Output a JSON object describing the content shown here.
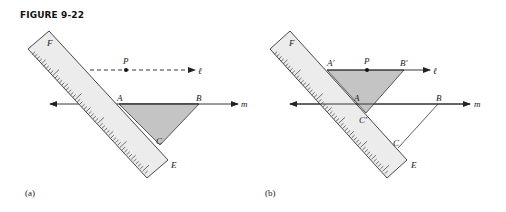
{
  "figure": {
    "title": "FIGURE 9-22"
  },
  "panels": [
    {
      "caption": "(a)",
      "labels": {
        "F": "F",
        "E": "E",
        "P": "P",
        "A": "A",
        "B": "B",
        "C": "C",
        "line_l": "ℓ",
        "line_m": "m"
      }
    },
    {
      "caption": "(b)",
      "labels": {
        "F": "F",
        "E": "E",
        "P": "P",
        "A_prime": "A′",
        "B_prime": "B′",
        "A": "A",
        "B": "B",
        "C_prime": "C′",
        "C": "C",
        "line_l": "ℓ",
        "line_m": "m"
      }
    }
  ],
  "colors": {
    "ruler_fill": "#ececec",
    "triangle_fill": "#c4c4c4",
    "stroke": "#333333"
  }
}
